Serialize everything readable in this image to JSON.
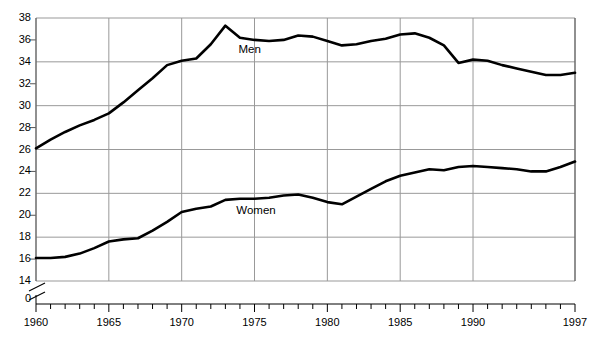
{
  "chart_data": {
    "type": "line",
    "title": "",
    "xlabel": "",
    "ylabel": "",
    "xlim": [
      1960,
      1997
    ],
    "ylim": [
      14,
      38
    ],
    "y_axis_break": true,
    "y_axis_break_label": "0",
    "grid": true,
    "grid_values": [
      14,
      18,
      22,
      26,
      30,
      34,
      38
    ],
    "minor_tick_values": [
      16,
      20,
      24,
      28,
      32,
      36
    ],
    "y_tick_labels": [
      "38",
      "36",
      "34",
      "32",
      "30",
      "28",
      "26",
      "24",
      "22",
      "20",
      "18",
      "16",
      "14",
      "0"
    ],
    "x_tick_labels": [
      "1960",
      "1965",
      "1970",
      "1975",
      "1980",
      "1985",
      "1990",
      "1997"
    ],
    "x_tick_values": [
      1960,
      1965,
      1970,
      1975,
      1980,
      1985,
      1990,
      1997
    ],
    "x_minor_tick_step": 1,
    "legend_position": "inline-annotation",
    "line_color": "#000000",
    "grid_color": "#999999",
    "axis_color": "#000000",
    "x": [
      1960,
      1961,
      1962,
      1963,
      1964,
      1965,
      1966,
      1967,
      1968,
      1969,
      1970,
      1971,
      1972,
      1973,
      1974,
      1975,
      1976,
      1977,
      1978,
      1979,
      1980,
      1981,
      1982,
      1983,
      1984,
      1985,
      1986,
      1987,
      1988,
      1989,
      1990,
      1991,
      1992,
      1993,
      1994,
      1995,
      1996,
      1997
    ],
    "series": [
      {
        "name": "Men",
        "label": "Men",
        "label_x": 1975.0,
        "label_y": 35.0,
        "values": [
          26.1,
          26.9,
          27.6,
          28.2,
          28.7,
          29.3,
          30.3,
          31.4,
          32.5,
          33.7,
          34.1,
          34.3,
          35.6,
          37.3,
          36.2,
          36.0,
          35.9,
          36.0,
          36.4,
          36.3,
          35.9,
          35.5,
          35.6,
          35.9,
          36.1,
          36.5,
          36.6,
          36.2,
          35.5,
          33.9,
          34.2,
          34.1,
          33.7,
          33.4,
          33.1,
          32.8,
          32.8,
          33.0
        ]
      },
      {
        "name": "Women",
        "label": "Women",
        "label_x": 1975.4,
        "label_y": 20.3,
        "values": [
          16.1,
          16.1,
          16.2,
          16.5,
          17.0,
          17.6,
          17.8,
          17.9,
          18.6,
          19.4,
          20.3,
          20.6,
          20.8,
          21.4,
          21.5,
          21.5,
          21.6,
          21.8,
          21.9,
          21.6,
          21.2,
          21.0,
          21.7,
          22.4,
          23.1,
          23.6,
          23.9,
          24.2,
          24.1,
          24.4,
          24.5,
          24.4,
          24.3,
          24.2,
          24.0,
          24.0,
          24.4,
          24.9
        ]
      }
    ]
  }
}
